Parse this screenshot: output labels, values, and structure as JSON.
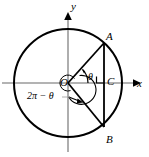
{
  "figure": {
    "type": "geometry-diagram",
    "background_color": "#ffffff",
    "stroke_color": "#000000",
    "axis_color": "#808080"
  },
  "axes": {
    "x_label": "x",
    "y_label": "y",
    "origin_label": "O"
  },
  "points": {
    "a": "A",
    "b": "B",
    "c": "C"
  },
  "angles": {
    "theta": "θ",
    "reflex": "2π − θ"
  },
  "geometry": {
    "center_x": 68,
    "center_y": 83,
    "radius": 54,
    "point_a_x": 104,
    "point_a_y": 43,
    "point_b_x": 104,
    "point_b_y": 127,
    "point_c_x": 104,
    "point_c_y": 83
  }
}
